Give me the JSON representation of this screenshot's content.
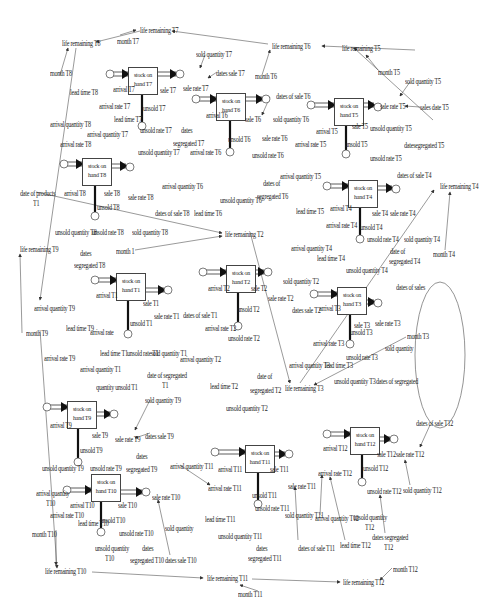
{
  "diagram": {
    "type": "system-dynamics stock-flow diagram",
    "stocks": [
      {
        "id": "T7",
        "line1": "stock on",
        "line2": "hand T7",
        "x": 128,
        "y": 67
      },
      {
        "id": "T6",
        "line1": "stock on",
        "line2": "hand T6",
        "x": 216,
        "y": 93
      },
      {
        "id": "T5",
        "line1": "stock on",
        "line2": "hand T5",
        "x": 334,
        "y": 98
      },
      {
        "id": "T4",
        "line1": "stock on",
        "line2": "hand T4",
        "x": 348,
        "y": 180
      },
      {
        "id": "T8",
        "line1": "stock on",
        "line2": "hand T8",
        "x": 82,
        "y": 158
      },
      {
        "id": "T2",
        "line1": "stock on",
        "line2": "hand T2",
        "x": 226,
        "y": 265
      },
      {
        "id": "T3",
        "line1": "stock on",
        "line2": "hand T3",
        "x": 337,
        "y": 287
      },
      {
        "id": "T1",
        "line1": "stock on",
        "line2": "hand T1",
        "x": 116,
        "y": 273
      },
      {
        "id": "T9",
        "line1": "stock on",
        "line2": "hand T9",
        "x": 67,
        "y": 401
      },
      {
        "id": "T10",
        "line1": "stock on",
        "line2": "hand T10",
        "x": 91,
        "y": 474
      },
      {
        "id": "T11",
        "line1": "stock on",
        "line2": "hand T11",
        "x": 245,
        "y": 445
      },
      {
        "id": "T12",
        "line1": "stock on",
        "line2": "hand T12",
        "x": 350,
        "y": 427
      }
    ],
    "labels": [
      {
        "t": "life remaining T7",
        "x": 140,
        "y": 27
      },
      {
        "t": "life remaining T8",
        "x": 62,
        "y": 40
      },
      {
        "t": "month T7",
        "x": 117,
        "y": 38
      },
      {
        "t": "life remaining T6",
        "x": 272,
        "y": 43
      },
      {
        "t": "life remaining T5",
        "x": 342,
        "y": 45
      },
      {
        "t": "month T6",
        "x": 255,
        "y": 73
      },
      {
        "t": "month T5",
        "x": 378,
        "y": 69
      },
      {
        "t": "sold quantity T7",
        "x": 196,
        "y": 51
      },
      {
        "t": "dates sale T7",
        "x": 216,
        "y": 70
      },
      {
        "t": "sold quantity T5",
        "x": 405,
        "y": 78
      },
      {
        "t": "sale rate T5",
        "x": 380,
        "y": 103
      },
      {
        "t": "sales date T5",
        "x": 420,
        "y": 104
      },
      {
        "t": "month T8",
        "x": 50,
        "y": 70
      },
      {
        "t": "lead time T8",
        "x": 70,
        "y": 89
      },
      {
        "t": "arrival T7",
        "x": 113,
        "y": 86
      },
      {
        "t": "sale rate T7",
        "x": 183,
        "y": 85
      },
      {
        "t": "sale T7",
        "x": 160,
        "y": 87
      },
      {
        "t": "dates of sale T6",
        "x": 276,
        "y": 93
      },
      {
        "t": "arrival rate T7",
        "x": 99,
        "y": 103
      },
      {
        "t": "unsold T7",
        "x": 143,
        "y": 105
      },
      {
        "t": "arrival T6",
        "x": 206,
        "y": 112
      },
      {
        "t": "sale T6",
        "x": 245,
        "y": 116
      },
      {
        "t": "sold quantity T6",
        "x": 273,
        "y": 116
      },
      {
        "t": "arrival T5",
        "x": 316,
        "y": 128
      },
      {
        "t": "sale T5",
        "x": 352,
        "y": 123
      },
      {
        "t": "unsold quantity T5",
        "x": 370,
        "y": 125
      },
      {
        "t": "arrival quantity T8",
        "x": 50,
        "y": 121
      },
      {
        "t": "lead time T7",
        "x": 114,
        "y": 116
      },
      {
        "t": "arrival quantity T7",
        "x": 87,
        "y": 131
      },
      {
        "t": "unsold rate T7",
        "x": 140,
        "y": 127
      },
      {
        "t": "dates",
        "x": 181,
        "y": 127
      },
      {
        "t": "segregated T7",
        "x": 173,
        "y": 140
      },
      {
        "t": "sale rate T6",
        "x": 262,
        "y": 135
      },
      {
        "t": "unsold T6",
        "x": 228,
        "y": 136
      },
      {
        "t": "arrival rate T5",
        "x": 295,
        "y": 141
      },
      {
        "t": "unsold T5",
        "x": 345,
        "y": 141
      },
      {
        "t": "datesegregated T5",
        "x": 404,
        "y": 142
      },
      {
        "t": "arrival rate T8",
        "x": 60,
        "y": 141
      },
      {
        "t": "unsold quantity T7",
        "x": 138,
        "y": 149
      },
      {
        "t": "arrival rate T6",
        "x": 190,
        "y": 149
      },
      {
        "t": "unsold rate T6",
        "x": 252,
        "y": 152
      },
      {
        "t": "unsold rate T5",
        "x": 370,
        "y": 155
      },
      {
        "t": "arrival quantity T5",
        "x": 280,
        "y": 173
      },
      {
        "t": "dates of",
        "x": 263,
        "y": 180
      },
      {
        "t": "segregated T6",
        "x": 257,
        "y": 193
      },
      {
        "t": "dates of sale T4",
        "x": 397,
        "y": 172
      },
      {
        "t": "life remaining T4",
        "x": 440,
        "y": 183
      },
      {
        "t": "arrival quantity T6",
        "x": 162,
        "y": 183
      },
      {
        "t": "lead time T6",
        "x": 194,
        "y": 210
      },
      {
        "t": "unsold quantity T6",
        "x": 220,
        "y": 197
      },
      {
        "t": "date of products",
        "x": 20,
        "y": 190
      },
      {
        "t": "T1",
        "x": 33,
        "y": 200
      },
      {
        "t": "arrival T8",
        "x": 64,
        "y": 190
      },
      {
        "t": "sale T8",
        "x": 104,
        "y": 190
      },
      {
        "t": "sale rate T8",
        "x": 128,
        "y": 194
      },
      {
        "t": "dates of sale T8",
        "x": 155,
        "y": 210
      },
      {
        "t": "unsold T8",
        "x": 97,
        "y": 204
      },
      {
        "t": "lead time T5",
        "x": 296,
        "y": 208
      },
      {
        "t": "arrival T4",
        "x": 330,
        "y": 205
      },
      {
        "t": "sale T4",
        "x": 372,
        "y": 210
      },
      {
        "t": "sale rate T4",
        "x": 390,
        "y": 210
      },
      {
        "t": "arrival rate T4",
        "x": 326,
        "y": 222
      },
      {
        "t": "unsold T4",
        "x": 360,
        "y": 224
      },
      {
        "t": "life remaining T2",
        "x": 225,
        "y": 231
      },
      {
        "t": "unsold quantity T8",
        "x": 55,
        "y": 229
      },
      {
        "t": "unsold rate T8",
        "x": 92,
        "y": 229
      },
      {
        "t": "sold quantity T8",
        "x": 132,
        "y": 229
      },
      {
        "t": "unsold rate T4",
        "x": 367,
        "y": 236
      },
      {
        "t": "sold quantity T4",
        "x": 404,
        "y": 236
      },
      {
        "t": "arrival quantity T4",
        "x": 291,
        "y": 245
      },
      {
        "t": "date of",
        "x": 390,
        "y": 248
      },
      {
        "t": "segregated T4",
        "x": 389,
        "y": 258
      },
      {
        "t": "month T4",
        "x": 433,
        "y": 251
      },
      {
        "t": "lead time T4",
        "x": 317,
        "y": 255
      },
      {
        "t": "unsold quantity T4",
        "x": 346,
        "y": 267
      },
      {
        "t": "month 1",
        "x": 116,
        "y": 248
      },
      {
        "t": "dates",
        "x": 80,
        "y": 250
      },
      {
        "t": "segregated T8",
        "x": 74,
        "y": 262
      },
      {
        "t": "life remaining T9",
        "x": 20,
        "y": 246
      },
      {
        "t": "dates of sales",
        "x": 396,
        "y": 284
      },
      {
        "t": "sold quantity T2",
        "x": 283,
        "y": 278
      },
      {
        "t": "arrival T2",
        "x": 208,
        "y": 285
      },
      {
        "t": "sale T2",
        "x": 251,
        "y": 285
      },
      {
        "t": "sale rate T2",
        "x": 268,
        "y": 295
      },
      {
        "t": "dates sale T2",
        "x": 292,
        "y": 307
      },
      {
        "t": "arrival T3",
        "x": 319,
        "y": 305
      },
      {
        "t": "sale T3",
        "x": 354,
        "y": 322
      },
      {
        "t": "sale rate T3",
        "x": 375,
        "y": 320
      },
      {
        "t": "unsold T3",
        "x": 350,
        "y": 329
      },
      {
        "t": "month T3",
        "x": 407,
        "y": 333
      },
      {
        "t": "arrival T1",
        "x": 96,
        "y": 292
      },
      {
        "t": "sale T1",
        "x": 143,
        "y": 300
      },
      {
        "t": "arrival quantity T9",
        "x": 34,
        "y": 305
      },
      {
        "t": "sale rate T1",
        "x": 154,
        "y": 313
      },
      {
        "t": "dates of sale T1",
        "x": 183,
        "y": 312
      },
      {
        "t": "unsold T2",
        "x": 237,
        "y": 306
      },
      {
        "t": "arrival rate T2",
        "x": 205,
        "y": 325
      },
      {
        "t": "unsold T1",
        "x": 130,
        "y": 320
      },
      {
        "t": "arrival rate T3",
        "x": 313,
        "y": 340
      },
      {
        "t": "sold quantity",
        "x": 385,
        "y": 345
      },
      {
        "t": "month T9",
        "x": 26,
        "y": 330
      },
      {
        "t": "lead time T9",
        "x": 66,
        "y": 325
      },
      {
        "t": "arrival rate",
        "x": 90,
        "y": 329
      },
      {
        "t": "unsold rate T2",
        "x": 228,
        "y": 335
      },
      {
        "t": "unsold rate T3",
        "x": 346,
        "y": 354
      },
      {
        "t": "arrival rate T9",
        "x": 44,
        "y": 355
      },
      {
        "t": "lead time T1",
        "x": 100,
        "y": 350
      },
      {
        "t": "unsold rate T1",
        "x": 127,
        "y": 350
      },
      {
        "t": "sold quantity T1",
        "x": 151,
        "y": 350
      },
      {
        "t": "arrival quantity T2",
        "x": 180,
        "y": 356
      },
      {
        "t": "arrival quantity T3",
        "x": 289,
        "y": 362
      },
      {
        "t": "lead time T3",
        "x": 325,
        "y": 362
      },
      {
        "t": "arrival quantity T1",
        "x": 80,
        "y": 366
      },
      {
        "t": "date of segregated",
        "x": 147,
        "y": 372
      },
      {
        "t": "T1",
        "x": 162,
        "y": 382
      },
      {
        "t": "lead time T2",
        "x": 210,
        "y": 383
      },
      {
        "t": "date of",
        "x": 257,
        "y": 373
      },
      {
        "t": "segregated T2",
        "x": 250,
        "y": 387
      },
      {
        "t": "unsold quantity T3",
        "x": 334,
        "y": 378
      },
      {
        "t": "dates of segregated",
        "x": 376,
        "y": 378
      },
      {
        "t": "quantity unsold T1",
        "x": 96,
        "y": 384
      },
      {
        "t": "life remaining T3",
        "x": 285,
        "y": 385
      },
      {
        "t": "sold quantity T9",
        "x": 145,
        "y": 397
      },
      {
        "t": "unsold quantity T2",
        "x": 226,
        "y": 405
      },
      {
        "t": "arrival T9",
        "x": 50,
        "y": 422
      },
      {
        "t": "sale T9",
        "x": 92,
        "y": 432
      },
      {
        "t": "sale rate T9",
        "x": 115,
        "y": 436
      },
      {
        "t": "dates sale T9",
        "x": 145,
        "y": 433
      },
      {
        "t": "unsold T9",
        "x": 80,
        "y": 447
      },
      {
        "t": "dates",
        "x": 136,
        "y": 453
      },
      {
        "t": "segregated T9",
        "x": 126,
        "y": 466
      },
      {
        "t": "unsold quantity T9",
        "x": 42,
        "y": 465
      },
      {
        "t": "unsold rate T9",
        "x": 90,
        "y": 465
      },
      {
        "t": "arrival quantity T11",
        "x": 170,
        "y": 463
      },
      {
        "t": "arrival T11",
        "x": 218,
        "y": 466
      },
      {
        "t": "arrival rate T11",
        "x": 208,
        "y": 485
      },
      {
        "t": "lead time T11",
        "x": 205,
        "y": 516
      },
      {
        "t": "sale T11",
        "x": 270,
        "y": 466
      },
      {
        "t": "sale rate T11",
        "x": 288,
        "y": 483
      },
      {
        "t": "unsold T11",
        "x": 252,
        "y": 492
      },
      {
        "t": "unsold rate T11",
        "x": 255,
        "y": 505
      },
      {
        "t": "sold quantity T11",
        "x": 285,
        "y": 512
      },
      {
        "t": "unsold quantity T11",
        "x": 218,
        "y": 533
      },
      {
        "t": "dates",
        "x": 256,
        "y": 545
      },
      {
        "t": "segregated T11",
        "x": 248,
        "y": 555
      },
      {
        "t": "dates of sale T11",
        "x": 298,
        "y": 545
      },
      {
        "t": "arrival quantity T12",
        "x": 315,
        "y": 515
      },
      {
        "t": "lead time T12",
        "x": 340,
        "y": 542
      },
      {
        "t": "arrival T12",
        "x": 323,
        "y": 445
      },
      {
        "t": "arrival rate T12",
        "x": 318,
        "y": 470
      },
      {
        "t": "sale T12",
        "x": 377,
        "y": 451
      },
      {
        "t": "sale rate T12",
        "x": 396,
        "y": 451
      },
      {
        "t": "dates of sale T12",
        "x": 416,
        "y": 420
      },
      {
        "t": "unsold T12",
        "x": 363,
        "y": 465
      },
      {
        "t": "unsold rate T12",
        "x": 367,
        "y": 488
      },
      {
        "t": "sold quantity T12",
        "x": 403,
        "y": 487
      },
      {
        "t": "unsold quantity",
        "x": 353,
        "y": 514
      },
      {
        "t": "T12",
        "x": 365,
        "y": 524
      },
      {
        "t": "dates segregated",
        "x": 372,
        "y": 534
      },
      {
        "t": "T12",
        "x": 384,
        "y": 544
      },
      {
        "t": "month T12",
        "x": 393,
        "y": 566
      },
      {
        "t": "life remaining T12",
        "x": 343,
        "y": 579
      },
      {
        "t": "arrival quantity",
        "x": 36,
        "y": 490
      },
      {
        "t": "T10",
        "x": 46,
        "y": 500
      },
      {
        "t": "arrival T10",
        "x": 70,
        "y": 502
      },
      {
        "t": "arrival rate T10",
        "x": 50,
        "y": 512
      },
      {
        "t": "lead time T10",
        "x": 78,
        "y": 520
      },
      {
        "t": "sale T10",
        "x": 118,
        "y": 502
      },
      {
        "t": "sale rate T10",
        "x": 152,
        "y": 494
      },
      {
        "t": "unsold T10",
        "x": 100,
        "y": 517
      },
      {
        "t": "unsold rate T10",
        "x": 119,
        "y": 530
      },
      {
        "t": "sold quantity",
        "x": 165,
        "y": 525
      },
      {
        "t": "month T10",
        "x": 32,
        "y": 531
      },
      {
        "t": "unsold quantity",
        "x": 95,
        "y": 545
      },
      {
        "t": "T10",
        "x": 105,
        "y": 555
      },
      {
        "t": "dates",
        "x": 142,
        "y": 545
      },
      {
        "t": "segregated T10",
        "x": 130,
        "y": 557
      },
      {
        "t": "dates sale T10",
        "x": 165,
        "y": 557
      },
      {
        "t": "life remaining T10",
        "x": 45,
        "y": 568
      },
      {
        "t": "life remaining T11",
        "x": 207,
        "y": 575
      },
      {
        "t": "month T11",
        "x": 238,
        "y": 591
      }
    ]
  }
}
